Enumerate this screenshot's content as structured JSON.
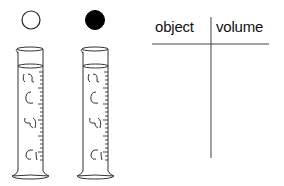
{
  "figure": {
    "objects": [
      {
        "id": "open-circle",
        "fill": "#ffffff",
        "stroke": "#222222"
      },
      {
        "id": "filled-circle",
        "fill": "#000000",
        "stroke": "#000000"
      }
    ],
    "cylinders": [
      {
        "id": "cylinder-1",
        "liquid_level": "filled near top"
      },
      {
        "id": "cylinder-2",
        "liquid_level": "filled near top"
      }
    ]
  },
  "table": {
    "headers": [
      "object",
      "volume"
    ],
    "rows": []
  },
  "colors": {
    "line": "#333333",
    "background": "#ffffff"
  }
}
